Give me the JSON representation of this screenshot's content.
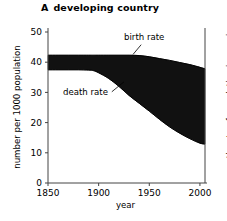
{
  "chart_data": {
    "type": "area",
    "title_letter": "A",
    "title_rest": "developing country",
    "xlabel": "year",
    "ylabel": "number per 1000 population",
    "ylabel_right": "growth rate of population increasing",
    "xlim": [
      1850,
      2005
    ],
    "ylim": [
      0,
      50
    ],
    "xticks": [
      1850,
      1900,
      1950,
      2000
    ],
    "xtick_labels": [
      "1850",
      "1900",
      "1950",
      "2000"
    ],
    "yticks": [
      0,
      10,
      20,
      30,
      40,
      50
    ],
    "ytick_labels": [
      "0",
      "10",
      "20",
      "30",
      "40",
      "50"
    ],
    "grid": false,
    "legend_position": "inline-annotations",
    "fill_color": "#111111",
    "line_color": "#000000",
    "axis_color": "#444444",
    "x": [
      1850,
      1860,
      1870,
      1880,
      1890,
      1895,
      1900,
      1910,
      1920,
      1930,
      1940,
      1950,
      1960,
      1970,
      1980,
      1990,
      2000,
      2005
    ],
    "series": [
      {
        "name": "birth rate",
        "label": "birth rate",
        "values": [
          42.3,
          42.3,
          42.3,
          42.3,
          42.3,
          42.3,
          42.3,
          42.3,
          42.3,
          42.3,
          42.2,
          41.8,
          41.2,
          40.6,
          39.9,
          39.2,
          38.3,
          37.8
        ]
      },
      {
        "name": "death rate",
        "label": "death rate",
        "values": [
          37.5,
          37.5,
          37.5,
          37.5,
          37.4,
          37.2,
          36.5,
          34.6,
          32.0,
          29.0,
          26.4,
          23.8,
          21.1,
          18.6,
          16.5,
          14.7,
          13.2,
          12.9
        ]
      }
    ],
    "annotations": [
      {
        "name": "birth-rate-annotation",
        "text": "birth rate",
        "text_x": 1945,
        "text_y": 47.2,
        "leader_from": [
          1942,
          45.8
        ],
        "leader_to": [
          1934,
          42.6
        ]
      },
      {
        "name": "death-rate-annotation",
        "text": "death rate",
        "text_x": 1887,
        "text_y": 29.0,
        "leader_from": [
          1913,
          30.2
        ],
        "leader_to": [
          1925,
          33.5
        ]
      }
    ]
  }
}
